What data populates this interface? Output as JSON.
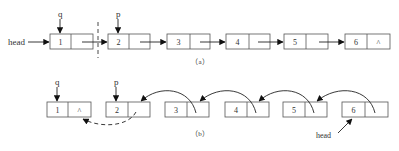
{
  "diagram": {
    "part_a": {
      "caption": "（a）",
      "head_label": "head",
      "nodes": [
        {
          "value": "1",
          "next": ""
        },
        {
          "value": "2",
          "next": ""
        },
        {
          "value": "3",
          "next": ""
        },
        {
          "value": "4",
          "next": ""
        },
        {
          "value": "5",
          "next": ""
        },
        {
          "value": "6",
          "next": "^"
        }
      ],
      "pointers": [
        {
          "name": "q",
          "node_index": 0
        },
        {
          "name": "p",
          "node_index": 1
        }
      ]
    },
    "part_b": {
      "caption": "（b）",
      "head_label": "head",
      "nodes": [
        {
          "value": "1",
          "next": "^"
        },
        {
          "value": "2",
          "next": ""
        },
        {
          "value": "3",
          "next": ""
        },
        {
          "value": "4",
          "next": ""
        },
        {
          "value": "5",
          "next": ""
        },
        {
          "value": "6",
          "next": ""
        }
      ],
      "pointers": [
        {
          "name": "q",
          "node_index": 0
        },
        {
          "name": "p",
          "node_index": 1
        }
      ]
    }
  }
}
